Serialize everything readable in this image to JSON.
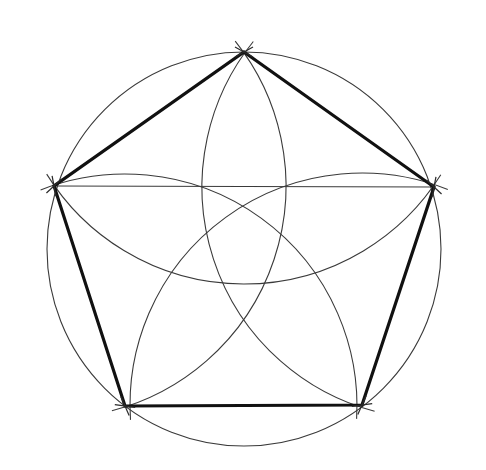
{
  "diagram": {
    "type": "geometric-construction",
    "colors": {
      "background": "#ffffff",
      "construction_line": "#3a3a3a",
      "pentagon": "#111111"
    },
    "outer_circle": {
      "cx": 244,
      "cy": 249,
      "r": 197
    },
    "vertices": [
      {
        "id": "top",
        "x": 244,
        "y": 52
      },
      {
        "id": "right",
        "x": 434,
        "y": 187
      },
      {
        "id": "bottom-right",
        "x": 362,
        "y": 405
      },
      {
        "id": "bottom-left",
        "x": 125,
        "y": 406
      },
      {
        "id": "left",
        "x": 54,
        "y": 186
      }
    ],
    "arc_radius": 232,
    "chord": {
      "from": "left",
      "to": "right"
    },
    "labels": []
  }
}
